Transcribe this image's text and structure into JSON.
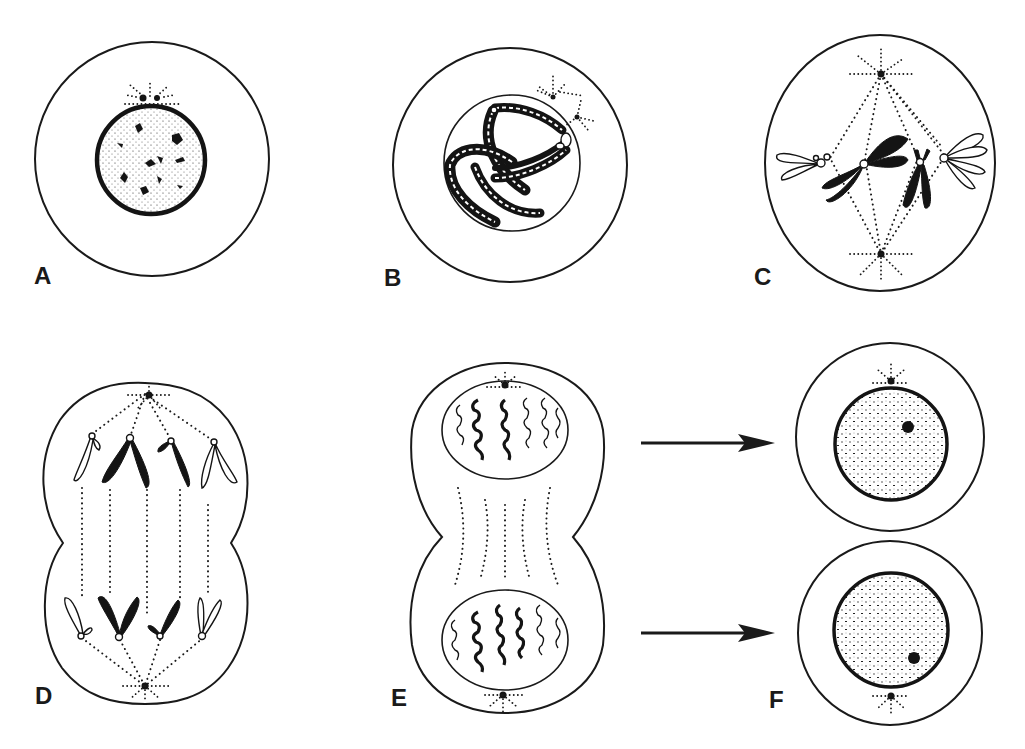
{
  "figure": {
    "panels": [
      {
        "id": "A",
        "label": "A",
        "stage": "interphase"
      },
      {
        "id": "B",
        "label": "B",
        "stage": "prophase"
      },
      {
        "id": "C",
        "label": "C",
        "stage": "metaphase"
      },
      {
        "id": "D",
        "label": "D",
        "stage": "anaphase"
      },
      {
        "id": "E",
        "label": "E",
        "stage": "telophase"
      },
      {
        "id": "F",
        "label": "F",
        "stage": "daughter cells"
      }
    ],
    "arrows": [
      {
        "from": "E",
        "to": "F",
        "position": "upper"
      },
      {
        "from": "E",
        "to": "F",
        "position": "lower"
      }
    ],
    "colors": {
      "ink": "#1a1a1a",
      "background": "#ffffff"
    }
  }
}
